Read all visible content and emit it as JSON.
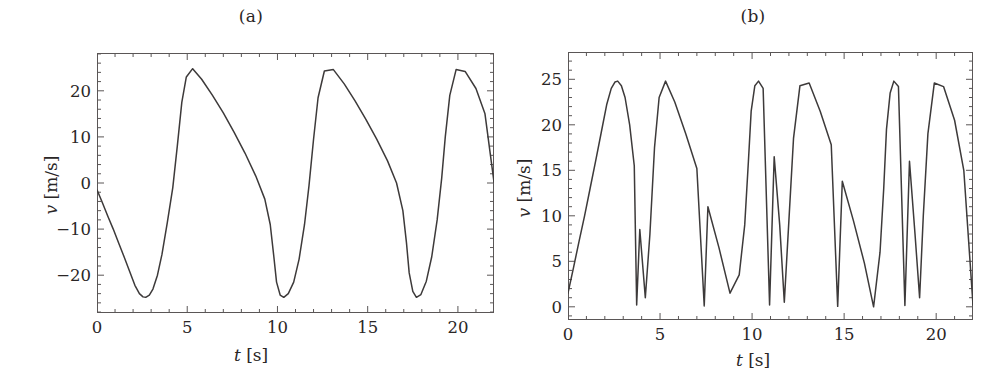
{
  "figure": {
    "background": "#ffffff",
    "line_color": "#3d3a3a",
    "axis_color": "#5a5656",
    "text_color": "#2a2626"
  },
  "panels": [
    {
      "id": "panel-a",
      "title": "(a)",
      "xlabel_var": "t",
      "xlabel_unit": "[s]",
      "ylabel_var": "v",
      "ylabel_unit": "[m/s]",
      "xticks": [
        0,
        5,
        10,
        15,
        20
      ],
      "yticks": [
        -20,
        -10,
        0,
        10,
        20
      ],
      "xtick_labels": [
        "0",
        "5",
        "10",
        "15",
        "20"
      ],
      "ytick_labels": [
        "-20",
        "-10",
        "0",
        "10",
        "20"
      ],
      "xlim": [
        0,
        22
      ],
      "ylim": [
        -28.2,
        28.2
      ],
      "x_minor_step": 1,
      "y_minor_step": 2,
      "grid": false
    },
    {
      "id": "panel-b",
      "title": "(b)",
      "xlabel_var": "t",
      "xlabel_unit": "[s]",
      "ylabel_var": "v",
      "ylabel_unit": "[m/s]",
      "xticks": [
        0,
        5,
        10,
        15,
        20
      ],
      "yticks": [
        0,
        5,
        10,
        15,
        20,
        25
      ],
      "xtick_labels": [
        "0",
        "5",
        "10",
        "15",
        "20"
      ],
      "ytick_labels": [
        "0",
        "5",
        "10",
        "15",
        "20",
        "25"
      ],
      "xlim": [
        0,
        22
      ],
      "ylim": [
        -1.45,
        28.0
      ],
      "x_minor_step": 1,
      "y_minor_step": 1,
      "grid": false
    }
  ],
  "chart_data": [
    {
      "type": "line",
      "title": "(a)",
      "xlabel": "t [s]",
      "ylabel": "v [m/s]",
      "xlim": [
        0,
        22
      ],
      "ylim": [
        -28.2,
        28.2
      ],
      "grid": false,
      "legend": null,
      "series": [
        {
          "name": "v(t)",
          "color": "#3d3a3a",
          "description": "Asymmetric sawtooth velocity: linear decay from near zero to -24.8 m/s, steep rounded rise to +24.8 m/s, then long linear decay; period about 7.25 s",
          "amplitude": 24.8,
          "period": 7.25,
          "x": [
            0.0,
            0.3,
            0.6,
            0.9,
            1.2,
            1.5,
            1.8,
            2.1,
            2.35,
            2.55,
            2.7,
            2.9,
            3.1,
            3.35,
            3.6,
            3.9,
            4.2,
            4.45,
            4.7,
            4.95,
            5.3,
            5.8,
            6.4,
            7.0,
            7.6,
            8.2,
            8.8,
            9.3,
            9.6,
            9.8,
            9.95,
            10.15,
            10.35,
            10.6,
            10.9,
            11.2,
            11.5,
            11.75,
            12.0,
            12.25,
            12.6,
            13.1,
            13.7,
            14.3,
            14.9,
            15.5,
            16.1,
            16.6,
            16.95,
            17.15,
            17.3,
            17.5,
            17.7,
            17.95,
            18.25,
            18.55,
            18.85,
            19.1,
            19.3,
            19.55,
            19.9,
            20.4,
            21.0,
            21.5,
            22.0
          ],
          "y": [
            -1.5,
            -4.3,
            -7.2,
            -10.0,
            -13.0,
            -16.0,
            -19.1,
            -22.2,
            -24.0,
            -24.7,
            -24.8,
            -24.3,
            -23.0,
            -20.0,
            -15.5,
            -8.5,
            -1.0,
            8.0,
            17.5,
            23.0,
            24.8,
            22.5,
            19.0,
            15.2,
            11.0,
            6.5,
            1.5,
            -3.5,
            -9.0,
            -16.0,
            -21.5,
            -24.3,
            -24.8,
            -24.0,
            -21.5,
            -16.5,
            -9.0,
            -0.5,
            9.5,
            18.5,
            24.3,
            24.6,
            21.5,
            17.8,
            13.8,
            9.5,
            4.8,
            0.0,
            -6.0,
            -13.0,
            -19.5,
            -23.5,
            -24.8,
            -24.2,
            -21.3,
            -16.0,
            -8.0,
            1.0,
            10.0,
            19.0,
            24.6,
            24.2,
            20.5,
            15.0,
            0.2
          ]
        }
      ]
    },
    {
      "type": "line",
      "title": "(b)",
      "xlabel": "t [s]",
      "ylabel": "v [m/s]",
      "xlim": [
        0,
        22
      ],
      "ylim": [
        -1.45,
        28.0
      ],
      "grid": false,
      "legend": null,
      "series": [
        {
          "name": "|v(t)|",
          "color": "#3d3a3a",
          "description": "Absolute value (rectified) of the panel (a) signal: six rounded peaks at 24.8 m/s with sharp V cusps touching zero at the zero crossings",
          "amplitude": 24.8,
          "peaks_t": [
            2.65,
            4.75,
            9.95,
            12.05,
            17.2,
            19.25
          ],
          "peaks_v": [
            24.8,
            24.8,
            24.8,
            24.8,
            24.8,
            24.8
          ],
          "cusps_t": [
            3.73,
            7.4,
            10.95,
            14.65,
            18.3,
            22.0
          ],
          "cusps_v": [
            0.2,
            0.1,
            0.2,
            0.05,
            0.15,
            0.2
          ],
          "x": [
            0.0,
            0.3,
            0.6,
            0.9,
            1.2,
            1.5,
            1.8,
            2.1,
            2.35,
            2.55,
            2.7,
            2.9,
            3.1,
            3.35,
            3.6,
            3.73,
            3.9,
            4.2,
            4.45,
            4.7,
            4.95,
            5.3,
            5.8,
            6.4,
            7.0,
            7.4,
            7.6,
            8.2,
            8.8,
            9.3,
            9.6,
            9.8,
            9.95,
            10.15,
            10.35,
            10.6,
            10.95,
            11.2,
            11.5,
            11.75,
            12.0,
            12.25,
            12.6,
            13.1,
            13.7,
            14.3,
            14.65,
            14.9,
            15.5,
            16.1,
            16.6,
            16.95,
            17.15,
            17.3,
            17.5,
            17.7,
            17.95,
            18.3,
            18.55,
            18.85,
            19.1,
            19.3,
            19.55,
            19.9,
            20.4,
            21.0,
            21.5,
            22.0
          ],
          "y": [
            1.5,
            4.3,
            7.2,
            10.0,
            13.0,
            16.0,
            19.1,
            22.2,
            24.0,
            24.7,
            24.8,
            24.3,
            23.0,
            20.0,
            15.5,
            0.2,
            8.5,
            1.0,
            8.0,
            17.5,
            23.0,
            24.8,
            22.5,
            19.0,
            15.2,
            0.1,
            11.0,
            6.5,
            1.5,
            3.5,
            9.0,
            16.0,
            21.5,
            24.3,
            24.8,
            24.0,
            0.2,
            16.5,
            9.0,
            0.5,
            9.5,
            18.5,
            24.3,
            24.6,
            21.5,
            17.8,
            0.05,
            13.8,
            9.5,
            4.8,
            0.0,
            6.0,
            13.0,
            19.5,
            23.5,
            24.8,
            24.2,
            0.15,
            16.0,
            8.0,
            1.0,
            10.0,
            19.0,
            24.6,
            24.2,
            20.5,
            15.0,
            0.2
          ]
        }
      ]
    }
  ]
}
